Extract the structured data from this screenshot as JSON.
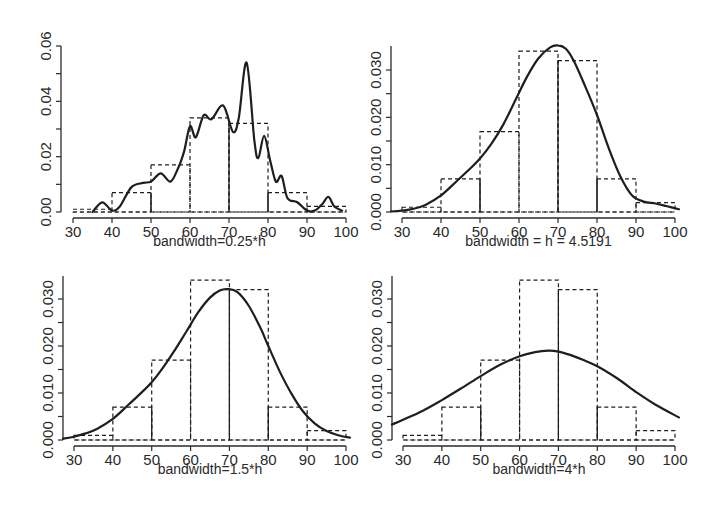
{
  "chart_data": [
    {
      "type": "histogram+line",
      "title": "",
      "xlabel": "bandwidth=0.25*h",
      "ylabel": "",
      "xlim": [
        30,
        100
      ],
      "ylim": [
        0,
        0.06
      ],
      "x_ticks": [
        30,
        40,
        50,
        60,
        70,
        80,
        90,
        100
      ],
      "x_tick_labels": [
        "30",
        "40",
        "50",
        "60",
        "70",
        "80",
        "90",
        "100"
      ],
      "y_ticks": [
        0,
        0.01,
        0.02,
        0.03,
        0.04,
        0.05,
        0.06
      ],
      "y_tick_labels": [
        "0.00",
        "",
        "0.02",
        "",
        "0.04",
        "",
        "0.06"
      ],
      "histogram": {
        "style": "dashed",
        "bins": [
          [
            30,
            40
          ],
          [
            40,
            50
          ],
          [
            50,
            60
          ],
          [
            60,
            70
          ],
          [
            70,
            80
          ],
          [
            80,
            90
          ],
          [
            90,
            100
          ]
        ],
        "density": [
          0.001,
          0.007,
          0.017,
          0.034,
          0.032,
          0.007,
          0.002
        ]
      },
      "density_curve": {
        "style": "solid",
        "x": [
          35,
          37.5,
          40,
          42,
          45,
          48,
          50,
          52.5,
          55,
          57,
          58.5,
          60,
          61.5,
          63.5,
          65.5,
          68.5,
          71,
          72.5,
          74.5,
          76.5,
          77.5,
          79,
          80.5,
          82,
          83.5,
          85,
          87.5,
          90,
          92,
          94,
          95.5,
          97,
          99
        ],
        "y": [
          0.0,
          0.0035,
          0.0005,
          0.002,
          0.009,
          0.0105,
          0.011,
          0.014,
          0.011,
          0.016,
          0.022,
          0.031,
          0.027,
          0.035,
          0.0335,
          0.0385,
          0.029,
          0.034,
          0.054,
          0.026,
          0.0195,
          0.0275,
          0.019,
          0.011,
          0.013,
          0.005,
          0.0035,
          0.0005,
          0.0005,
          0.003,
          0.0055,
          0.002,
          0.0005
        ]
      }
    },
    {
      "type": "histogram+line",
      "title": "",
      "xlabel": "bandwidth = h = 4.5191",
      "ylabel": "",
      "xlim": [
        30,
        100
      ],
      "ylim": [
        0,
        0.035
      ],
      "x_ticks": [
        30,
        40,
        50,
        60,
        70,
        80,
        90,
        100
      ],
      "x_tick_labels": [
        "30",
        "40",
        "50",
        "60",
        "70",
        "80",
        "90",
        "100"
      ],
      "y_ticks": [
        0,
        0.005,
        0.01,
        0.015,
        0.02,
        0.025,
        0.03
      ],
      "y_tick_labels": [
        "0.000",
        "",
        "0.010",
        "",
        "0.020",
        "",
        "0.030"
      ],
      "histogram": {
        "style": "dashed",
        "bins": [
          [
            30,
            40
          ],
          [
            40,
            50
          ],
          [
            50,
            60
          ],
          [
            60,
            70
          ],
          [
            70,
            80
          ],
          [
            80,
            90
          ],
          [
            90,
            100
          ]
        ],
        "density": [
          0.001,
          0.007,
          0.017,
          0.034,
          0.032,
          0.007,
          0.002
        ]
      },
      "density_curve": {
        "style": "solid",
        "x": [
          27,
          30,
          33,
          36,
          40,
          44,
          47,
          50,
          53,
          56,
          59,
          62,
          65,
          68,
          70,
          72,
          74,
          77,
          80,
          83,
          86,
          89,
          92,
          95,
          98,
          101
        ],
        "y": [
          0.0001,
          0.0003,
          0.0007,
          0.0015,
          0.0035,
          0.0065,
          0.0088,
          0.0113,
          0.0145,
          0.0185,
          0.0235,
          0.0285,
          0.0325,
          0.0348,
          0.0352,
          0.0345,
          0.032,
          0.0265,
          0.0205,
          0.0135,
          0.0075,
          0.0035,
          0.0022,
          0.0018,
          0.0012,
          0.0006
        ]
      }
    },
    {
      "type": "histogram+line",
      "title": "",
      "xlabel": "bandwidth=1.5*h",
      "ylabel": "",
      "xlim": [
        30,
        100
      ],
      "ylim": [
        0,
        0.035
      ],
      "x_ticks": [
        30,
        40,
        50,
        60,
        70,
        80,
        90,
        100
      ],
      "x_tick_labels": [
        "30",
        "40",
        "50",
        "60",
        "70",
        "80",
        "90",
        "100"
      ],
      "y_ticks": [
        0,
        0.005,
        0.01,
        0.015,
        0.02,
        0.025,
        0.03
      ],
      "y_tick_labels": [
        "0.000",
        "",
        "0.010",
        "",
        "0.020",
        "",
        "0.030"
      ],
      "histogram": {
        "style": "dashed",
        "bins": [
          [
            30,
            40
          ],
          [
            40,
            50
          ],
          [
            50,
            60
          ],
          [
            60,
            70
          ],
          [
            70,
            80
          ],
          [
            80,
            90
          ],
          [
            90,
            100
          ]
        ],
        "density": [
          0.001,
          0.007,
          0.017,
          0.034,
          0.032,
          0.007,
          0.002
        ]
      },
      "density_curve": {
        "style": "solid",
        "x": [
          27,
          30,
          33,
          36,
          40,
          44,
          47,
          50,
          53,
          56,
          59,
          62,
          65,
          67.5,
          69.5,
          72,
          75,
          78,
          80,
          83,
          86,
          89,
          92,
          95,
          98,
          101
        ],
        "y": [
          0.0003,
          0.0007,
          0.0014,
          0.0024,
          0.0045,
          0.0075,
          0.0098,
          0.0123,
          0.0155,
          0.0192,
          0.0232,
          0.0272,
          0.0303,
          0.0318,
          0.0321,
          0.0315,
          0.0285,
          0.0238,
          0.02,
          0.0145,
          0.0098,
          0.006,
          0.0035,
          0.0019,
          0.001,
          0.0005
        ]
      }
    },
    {
      "type": "histogram+line",
      "title": "",
      "xlabel": "bandwidth=4*h",
      "ylabel": "",
      "xlim": [
        30,
        100
      ],
      "ylim": [
        0,
        0.035
      ],
      "x_ticks": [
        30,
        40,
        50,
        60,
        70,
        80,
        90,
        100
      ],
      "x_tick_labels": [
        "30",
        "40",
        "50",
        "60",
        "70",
        "80",
        "90",
        "100"
      ],
      "y_ticks": [
        0,
        0.005,
        0.01,
        0.015,
        0.02,
        0.025,
        0.03
      ],
      "y_tick_labels": [
        "0.000",
        "",
        "0.010",
        "",
        "0.020",
        "",
        "0.030"
      ],
      "histogram": {
        "style": "dashed",
        "bins": [
          [
            30,
            40
          ],
          [
            40,
            50
          ],
          [
            50,
            60
          ],
          [
            60,
            70
          ],
          [
            70,
            80
          ],
          [
            80,
            90
          ],
          [
            90,
            100
          ]
        ],
        "density": [
          0.001,
          0.007,
          0.017,
          0.034,
          0.032,
          0.007,
          0.002
        ]
      },
      "density_curve": {
        "style": "solid",
        "x": [
          27,
          30,
          35,
          40,
          45,
          50,
          55,
          60,
          64,
          67.5,
          70,
          73,
          77,
          80,
          85,
          90,
          95,
          101
        ],
        "y": [
          0.0033,
          0.0043,
          0.0062,
          0.0085,
          0.011,
          0.0136,
          0.016,
          0.0178,
          0.0187,
          0.019,
          0.0188,
          0.0181,
          0.0168,
          0.0157,
          0.0132,
          0.0102,
          0.0075,
          0.0048
        ]
      }
    }
  ],
  "panels": [
    {
      "xlabel": "bandwidth=0.25*h"
    },
    {
      "xlabel": "bandwidth = h = 4.5191"
    },
    {
      "xlabel": "bandwidth=1.5*h"
    },
    {
      "xlabel": "bandwidth=4*h"
    }
  ],
  "colors": {
    "line": "#1e1e1e",
    "axis": "#2a2a2a",
    "background": "#ffffff"
  }
}
